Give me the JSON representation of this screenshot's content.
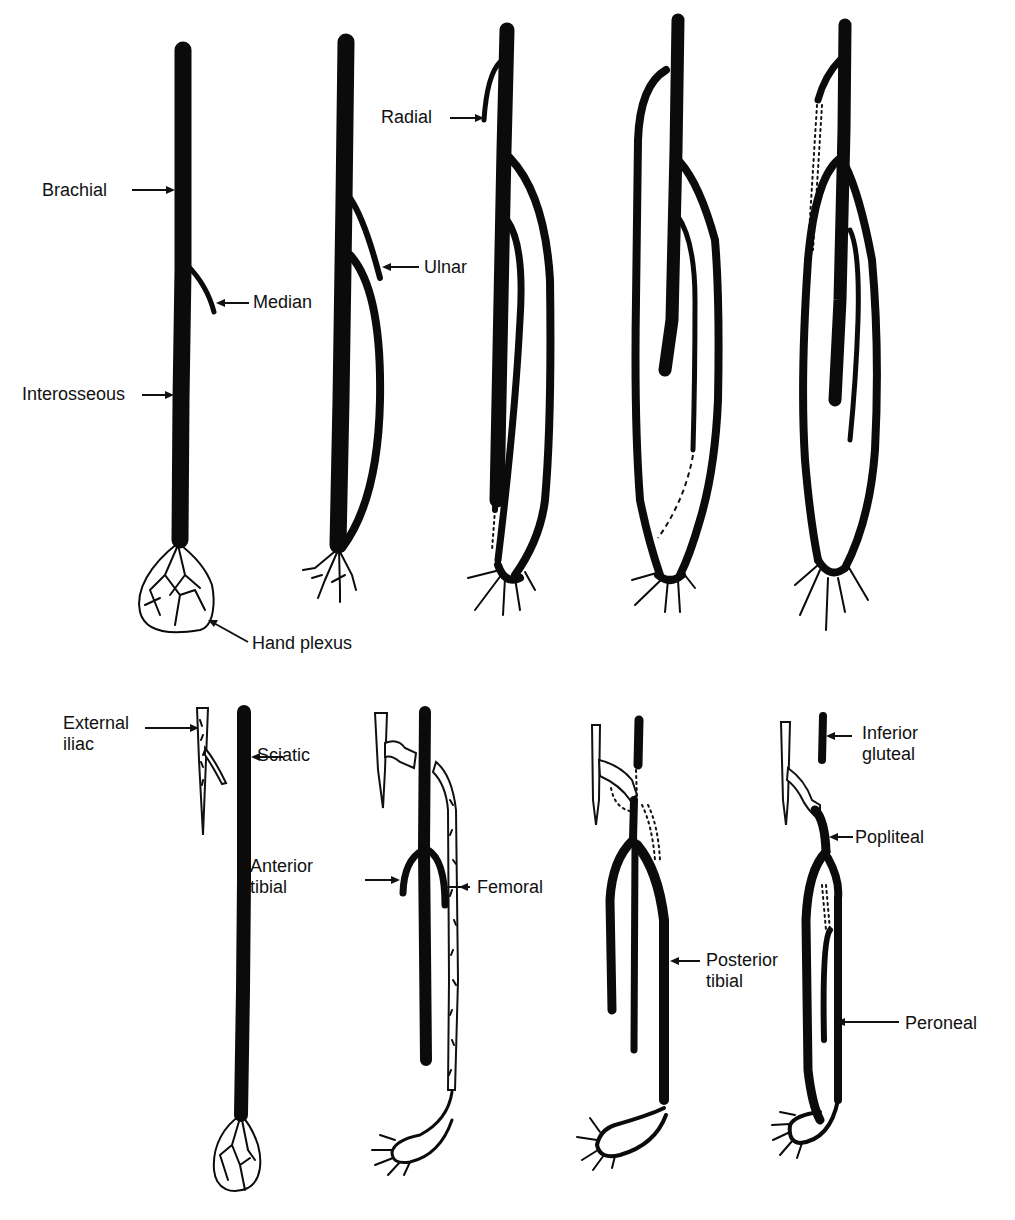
{
  "figure": {
    "rows": [
      {
        "name": "upper-limb",
        "stages": 5,
        "labels": [
          {
            "id": "brachial",
            "text": "Brachial",
            "x": 42,
            "y": 180
          },
          {
            "id": "median",
            "text": "Median",
            "x": 253,
            "y": 290
          },
          {
            "id": "interosseous",
            "text": "Interosseous",
            "x": 22,
            "y": 384
          },
          {
            "id": "hand-plexus",
            "text": "Hand plexus",
            "x": 252,
            "y": 633
          },
          {
            "id": "ulnar",
            "text": "Ulnar",
            "x": 424,
            "y": 257
          },
          {
            "id": "radial",
            "text": "Radial",
            "x": 381,
            "y": 107
          }
        ]
      },
      {
        "name": "lower-limb",
        "stages": 4,
        "labels": [
          {
            "id": "external-iliac",
            "text": "External\niliac",
            "x": 63,
            "y": 713
          },
          {
            "id": "sciatic",
            "text": "Sciatic",
            "x": 257,
            "y": 745
          },
          {
            "id": "anterior-tibial",
            "text": "Anterior\ntibial",
            "x": 250,
            "y": 856
          },
          {
            "id": "femoral",
            "text": "Femoral",
            "x": 477,
            "y": 877
          },
          {
            "id": "posterior-tibial",
            "text": "Posterior\ntibial",
            "x": 706,
            "y": 950
          },
          {
            "id": "inferior-gluteal",
            "text": "Inferior\ngluteal",
            "x": 862,
            "y": 723
          },
          {
            "id": "popliteal",
            "text": "Popliteal",
            "x": 855,
            "y": 827
          },
          {
            "id": "peroneal",
            "text": "Peroneal",
            "x": 905,
            "y": 1013
          }
        ]
      }
    ]
  }
}
